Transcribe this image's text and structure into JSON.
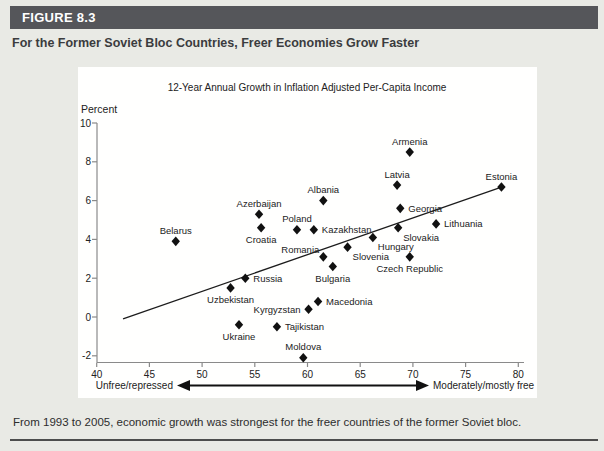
{
  "figure": {
    "label": "FIGURE 8.3",
    "title": "For the Former Soviet Bloc Countries, Freer Economies Grow Faster",
    "caption": "From 1993 to 2005, economic growth was strongest for the freer countries of the former Soviet bloc."
  },
  "colors": {
    "header_bar": "#55565a",
    "page_background": "#e9eae5",
    "panel_background": "#fffffe",
    "ink": "#1c1c1c",
    "axis": "#8a8a8a"
  },
  "chart_data": {
    "type": "scatter",
    "title": "12-Year Annual Growth in Inflation Adjusted Per-Capita Income",
    "ylabel": "Percent",
    "xlim": [
      40,
      80
    ],
    "ylim": [
      -2,
      10
    ],
    "x_ticks": [
      40,
      45,
      50,
      55,
      60,
      65,
      70,
      75,
      80
    ],
    "y_ticks": [
      -2,
      0,
      2,
      4,
      6,
      8,
      10
    ],
    "grid": false,
    "x_axis_annotation": {
      "left": "Unfree/repressed",
      "right": "Moderately/mostly free"
    },
    "trend_line": {
      "x1": 42.5,
      "y1": -0.1,
      "x2": 78.4,
      "y2": 6.7
    },
    "points": [
      {
        "name": "Belarus",
        "freedom": 47.5,
        "growth": 3.9,
        "label_pos": "above"
      },
      {
        "name": "Uzbekistan",
        "freedom": 52.7,
        "growth": 1.5,
        "label_pos": "below"
      },
      {
        "name": "Ukraine",
        "freedom": 53.5,
        "growth": -0.4,
        "label_pos": "below"
      },
      {
        "name": "Russia",
        "freedom": 54.1,
        "growth": 2.0,
        "label_pos": "right"
      },
      {
        "name": "Azerbaijan",
        "freedom": 55.4,
        "growth": 5.3,
        "label_pos": "above"
      },
      {
        "name": "Croatia",
        "freedom": 55.6,
        "growth": 4.6,
        "label_pos": "below"
      },
      {
        "name": "Tajikistan",
        "freedom": 57.1,
        "growth": -0.5,
        "label_pos": "right"
      },
      {
        "name": "Poland",
        "freedom": 59.0,
        "growth": 4.5,
        "label_pos": "above"
      },
      {
        "name": "Moldova",
        "freedom": 59.6,
        "growth": -2.1,
        "label_pos": "above"
      },
      {
        "name": "Kyrgyzstan",
        "freedom": 60.1,
        "growth": 0.4,
        "label_pos": "left"
      },
      {
        "name": "Kazakhstan",
        "freedom": 60.6,
        "growth": 4.5,
        "label_pos": "right"
      },
      {
        "name": "Macedonia",
        "freedom": 61.0,
        "growth": 0.8,
        "label_pos": "right"
      },
      {
        "name": "Albania",
        "freedom": 61.5,
        "growth": 6.0,
        "label_pos": "above"
      },
      {
        "name": "Romania",
        "freedom": 61.5,
        "growth": 3.1,
        "label_pos": "left-up"
      },
      {
        "name": "Bulgaria",
        "freedom": 62.4,
        "growth": 2.6,
        "label_pos": "below"
      },
      {
        "name": "Slovenia",
        "freedom": 63.8,
        "growth": 3.6,
        "label_pos": "below-right"
      },
      {
        "name": "Hungary",
        "freedom": 66.2,
        "growth": 4.1,
        "label_pos": "below-right"
      },
      {
        "name": "Latvia",
        "freedom": 68.5,
        "growth": 6.8,
        "label_pos": "above"
      },
      {
        "name": "Slovakia",
        "freedom": 68.6,
        "growth": 4.6,
        "label_pos": "below-right"
      },
      {
        "name": "Georgia",
        "freedom": 68.8,
        "growth": 5.6,
        "label_pos": "right"
      },
      {
        "name": "Armenia",
        "freedom": 69.7,
        "growth": 8.5,
        "label_pos": "above"
      },
      {
        "name": "Czech Republic",
        "freedom": 69.7,
        "growth": 3.1,
        "label_pos": "below"
      },
      {
        "name": "Lithuania",
        "freedom": 72.2,
        "growth": 4.8,
        "label_pos": "right"
      },
      {
        "name": "Estonia",
        "freedom": 78.4,
        "growth": 6.7,
        "label_pos": "above"
      }
    ]
  }
}
